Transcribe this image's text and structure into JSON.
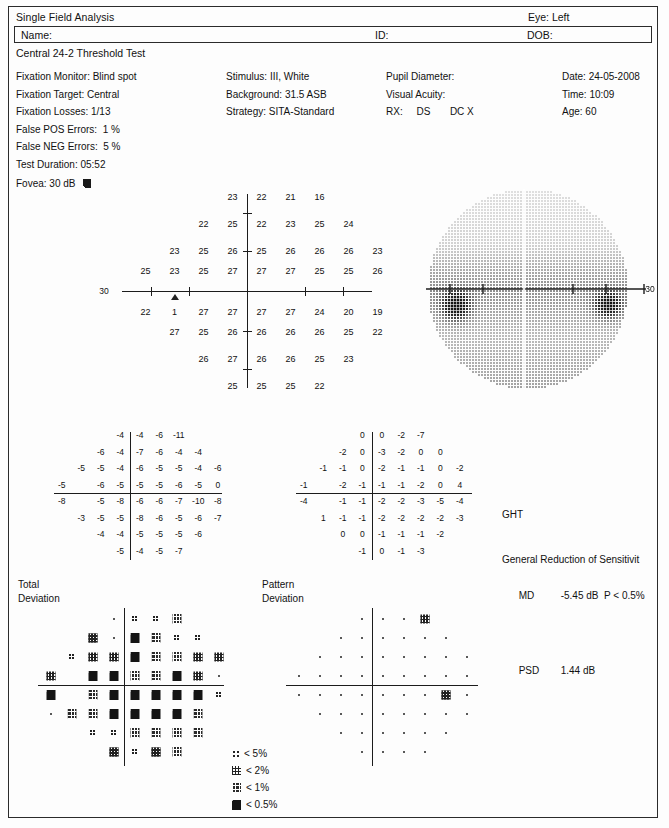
{
  "header": {
    "title": "Single Field Analysis",
    "eye": "Eye: Left",
    "name_label": "Name:",
    "id_label": "ID:",
    "dob_label": "DOB:",
    "test_name": "Central 24-2 Threshold Test"
  },
  "params": {
    "col1": "Fixation Monitor: Blind spot\nFixation Target: Central\nFixation Losses: 1/13\nFalse POS Errors:  1 %\nFalse NEG Errors:  5 %\nTest Duration: 05:52",
    "col2": "Stimulus: III, White\nBackground: 31.5 ASB\nStrategy: SITA-Standard",
    "col3": "Pupil Diameter:\nVisual Acuity:\nRX:     DS       DC X",
    "col4": "Date: 24-05-2008\nTime: 10:09\nAge: 60",
    "fovea": "Fovea: 30 dB"
  },
  "labels": {
    "total_deviation": "Total\nDeviation",
    "pattern_deviation": "Pattern\nDeviation",
    "axis_left": "30",
    "axis_right": "30"
  },
  "indices": {
    "ght_label": "GHT",
    "ght_value": "General Reduction of Sensitivit",
    "md_label": "MD",
    "md_value": "-5.45 dB  P < 0.5%",
    "psd_label": "PSD",
    "psd_value": "1.44 dB"
  },
  "legend": [
    {
      "symbol": "p5",
      "text": "< 5%"
    },
    {
      "symbol": "p2",
      "text": "< 2%"
    },
    {
      "symbol": "p1",
      "text": "< 1%"
    },
    {
      "symbol": "p05",
      "text": "< 0.5%"
    }
  ],
  "chart_data": {
    "type": "table",
    "threshold_grid": {
      "units": "dB",
      "rows": [
        {
          "cols": [
            3,
            4,
            5,
            6
          ],
          "values": [
            23,
            22,
            21,
            16
          ]
        },
        {
          "cols": [
            2,
            3,
            4,
            5,
            6,
            7
          ],
          "values": [
            22,
            25,
            22,
            23,
            25,
            24
          ]
        },
        {
          "cols": [
            1,
            2,
            3,
            4,
            5,
            6,
            7,
            8
          ],
          "values": [
            23,
            25,
            26,
            25,
            26,
            26,
            26,
            23
          ]
        },
        {
          "cols": [
            0,
            1,
            2,
            3,
            4,
            5,
            6,
            7,
            8
          ],
          "values": [
            25,
            23,
            25,
            27,
            27,
            27,
            25,
            25,
            26
          ]
        },
        {
          "cols": [
            0,
            1,
            2,
            3,
            4,
            5,
            6,
            7,
            8
          ],
          "values": [
            22,
            1,
            27,
            27,
            27,
            27,
            24,
            20,
            19
          ]
        },
        {
          "cols": [
            1,
            2,
            3,
            4,
            5,
            6,
            7,
            8
          ],
          "values": [
            27,
            25,
            26,
            26,
            26,
            26,
            25,
            22
          ]
        },
        {
          "cols": [
            2,
            3,
            4,
            5,
            6,
            7
          ],
          "values": [
            26,
            27,
            26,
            26,
            25,
            23
          ]
        },
        {
          "cols": [
            3,
            4,
            5,
            6
          ],
          "values": [
            25,
            25,
            25,
            22
          ]
        }
      ],
      "blind_spot_marker": "triangle"
    },
    "total_deviation": {
      "units": "dB",
      "rows": [
        {
          "cols": [
            3,
            4,
            5,
            6
          ],
          "values": [
            -4,
            -4,
            -6,
            -11
          ]
        },
        {
          "cols": [
            2,
            3,
            4,
            5,
            6,
            7
          ],
          "values": [
            -6,
            -4,
            -7,
            -6,
            -4,
            -4
          ]
        },
        {
          "cols": [
            1,
            2,
            3,
            4,
            5,
            6,
            7,
            8
          ],
          "values": [
            -5,
            -5,
            -4,
            -6,
            -5,
            -5,
            -4,
            -6
          ]
        },
        {
          "cols": [
            0,
            1,
            2,
            3,
            4,
            5,
            6,
            7,
            8
          ],
          "values": [
            -5,
            null,
            -6,
            -5,
            -5,
            -5,
            -6,
            -5,
            0
          ]
        },
        {
          "cols": [
            0,
            1,
            2,
            3,
            4,
            5,
            6,
            7,
            8
          ],
          "values": [
            -8,
            null,
            -5,
            -8,
            -6,
            -6,
            -7,
            -10,
            -8
          ]
        },
        {
          "cols": [
            1,
            2,
            3,
            4,
            5,
            6,
            7,
            8
          ],
          "values": [
            -3,
            -5,
            -5,
            -8,
            -6,
            -5,
            -6,
            -7
          ]
        },
        {
          "cols": [
            2,
            3,
            4,
            5,
            6,
            7
          ],
          "values": [
            -4,
            -4,
            -5,
            -5,
            -5,
            -6
          ]
        },
        {
          "cols": [
            3,
            4,
            5,
            6
          ],
          "values": [
            -5,
            -4,
            -5,
            -7
          ]
        }
      ]
    },
    "pattern_deviation": {
      "units": "dB",
      "rows": [
        {
          "cols": [
            3,
            4,
            5,
            6
          ],
          "values": [
            0,
            0,
            -2,
            -7
          ]
        },
        {
          "cols": [
            2,
            3,
            4,
            5,
            6,
            7
          ],
          "values": [
            -2,
            0,
            -3,
            -2,
            0,
            0
          ]
        },
        {
          "cols": [
            1,
            2,
            3,
            4,
            5,
            6,
            7,
            8
          ],
          "values": [
            -1,
            -1,
            0,
            -2,
            -1,
            -1,
            0,
            -2
          ]
        },
        {
          "cols": [
            0,
            1,
            2,
            3,
            4,
            5,
            6,
            7,
            8
          ],
          "values": [
            -1,
            null,
            -2,
            -1,
            -1,
            -1,
            -2,
            0,
            4
          ]
        },
        {
          "cols": [
            0,
            1,
            2,
            3,
            4,
            5,
            6,
            7,
            8
          ],
          "values": [
            -4,
            null,
            -1,
            -1,
            -2,
            -2,
            -3,
            -5,
            -4
          ]
        },
        {
          "cols": [
            1,
            2,
            3,
            4,
            5,
            6,
            7,
            8
          ],
          "values": [
            1,
            -1,
            -1,
            -2,
            -2,
            -2,
            -2,
            -3
          ]
        },
        {
          "cols": [
            2,
            3,
            4,
            5,
            6,
            7
          ],
          "values": [
            0,
            0,
            -1,
            -1,
            -1,
            -2
          ]
        },
        {
          "cols": [
            3,
            4,
            5,
            6
          ],
          "values": [
            -1,
            0,
            -1,
            -3
          ]
        }
      ]
    },
    "total_deviation_probability": {
      "symbol_key": {
        "dot": "within normal limits",
        "p5": "< 5%",
        "p2": "< 2%",
        "p1": "< 1%",
        "p05": "< 0.5%"
      },
      "rows": [
        {
          "cols": [
            3,
            4,
            5,
            6
          ],
          "symbols": [
            "dot",
            "p5",
            "p5",
            "p1"
          ]
        },
        {
          "cols": [
            2,
            3,
            4,
            5,
            6,
            7
          ],
          "symbols": [
            "p2",
            "dot",
            "p05",
            "p1",
            "p5",
            "p5"
          ]
        },
        {
          "cols": [
            1,
            2,
            3,
            4,
            5,
            6,
            7,
            8
          ],
          "symbols": [
            "p5",
            "p2",
            "p2",
            "p05",
            "p1",
            "p1",
            "p2",
            "p2"
          ]
        },
        {
          "cols": [
            0,
            1,
            2,
            3,
            4,
            5,
            6,
            7,
            8
          ],
          "symbols": [
            "p2",
            null,
            "p05",
            "p05",
            "p1",
            "p1",
            "p05",
            "p2",
            "dot"
          ]
        },
        {
          "cols": [
            0,
            1,
            2,
            3,
            4,
            5,
            6,
            7,
            8
          ],
          "symbols": [
            "p05",
            null,
            "p1",
            "p05",
            "p05",
            "p05",
            "p05",
            "p05",
            "p5"
          ]
        },
        {
          "cols": [
            0,
            1,
            2,
            3,
            4,
            5,
            6,
            7,
            8
          ],
          "symbols": [
            "dot",
            "p1",
            "p1",
            "p05",
            "p05",
            "p05",
            "p05",
            "p1",
            null
          ]
        },
        {
          "cols": [
            2,
            3,
            4,
            5,
            6,
            7
          ],
          "symbols": [
            "p5",
            "p5",
            "p1",
            "p1",
            "p1",
            "p1"
          ]
        },
        {
          "cols": [
            3,
            4,
            5,
            6
          ],
          "symbols": [
            "p2",
            "p5",
            "p2",
            "p1"
          ]
        }
      ]
    },
    "pattern_deviation_probability": {
      "symbol_key": {
        "dot": "within normal limits",
        "p2": "< 2%"
      },
      "rows": [
        {
          "cols": [
            3,
            4,
            5,
            6
          ],
          "symbols": [
            "dot",
            "dot",
            "dot",
            "p2"
          ]
        },
        {
          "cols": [
            2,
            3,
            4,
            5,
            6,
            7
          ],
          "symbols": [
            "dot",
            "dot",
            "dot",
            "dot",
            "dot",
            "dot"
          ]
        },
        {
          "cols": [
            1,
            2,
            3,
            4,
            5,
            6,
            7,
            8
          ],
          "symbols": [
            "dot",
            "dot",
            "dot",
            "dot",
            "dot",
            "dot",
            "dot",
            "dot"
          ]
        },
        {
          "cols": [
            0,
            1,
            2,
            3,
            4,
            5,
            6,
            7,
            8
          ],
          "symbols": [
            "dot",
            "dot",
            "dot",
            "dot",
            "dot",
            "dot",
            "dot",
            "dot",
            "dot"
          ]
        },
        {
          "cols": [
            0,
            1,
            2,
            3,
            4,
            5,
            6,
            7,
            8
          ],
          "symbols": [
            "dot",
            "dot",
            "dot",
            "dot",
            "dot",
            "dot",
            "dot",
            "p2",
            "dot"
          ]
        },
        {
          "cols": [
            1,
            2,
            3,
            4,
            5,
            6,
            7,
            8
          ],
          "symbols": [
            "dot",
            "dot",
            "dot",
            "dot",
            "dot",
            "dot",
            "dot",
            "dot"
          ]
        },
        {
          "cols": [
            2,
            3,
            4,
            5,
            6,
            7
          ],
          "symbols": [
            "dot",
            "dot",
            "dot",
            "dot",
            "dot",
            "dot"
          ]
        },
        {
          "cols": [
            3,
            4,
            5,
            6
          ],
          "symbols": [
            "dot",
            "dot",
            "dot",
            "dot"
          ]
        }
      ]
    },
    "grayscale": {
      "description": "Greyscale sensitivity map, left eye, with dense dark scotoma nasally and temporally along the horizontal meridian",
      "axis_label_right": "30"
    }
  }
}
